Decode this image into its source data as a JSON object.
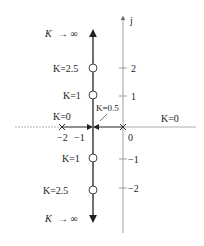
{
  "diagram": {
    "type": "root-locus",
    "axes": {
      "imag_label": "j",
      "real_ticks": [
        {
          "label": "−2",
          "value": -2
        },
        {
          "label": "−1",
          "value": -1
        },
        {
          "label": "0",
          "value": 0
        }
      ],
      "imag_ticks": [
        {
          "label": "2",
          "value": 2
        },
        {
          "label": "1",
          "value": 1
        },
        {
          "label": "−1",
          "value": -1
        },
        {
          "label": "−2",
          "value": -2
        }
      ]
    },
    "poles": [
      {
        "value": -2,
        "label": "K=0"
      },
      {
        "value": 0,
        "label": "K=0"
      }
    ],
    "breakaway": {
      "value": -1,
      "label": "K=0.5"
    },
    "locus_points": [
      {
        "label": "K=2.5",
        "imag": 2
      },
      {
        "label": "K=1",
        "imag": 1
      },
      {
        "label": "K=1",
        "imag": -1
      },
      {
        "label": "K=2.5",
        "imag": -2
      }
    ],
    "asymptote_labels": {
      "top": "K → ∞",
      "bottom": "K → ∞"
    }
  },
  "labels": {
    "j": "j",
    "k_inf_top_k": "K",
    "k_inf_top_rest": "→ ∞",
    "k_inf_bot_k": "K",
    "k_inf_bot_rest": "→ ∞",
    "k25_top": "K=2.5",
    "k1_top": "K=1",
    "k05": "K=0.5",
    "k0_left": "K=0",
    "k0_right": "K=0",
    "k1_bot": "K=1",
    "k25_bot": "K=2.5",
    "tick_2": "2",
    "tick_1": "1",
    "tick_m1": "−1",
    "tick_m2": "−2",
    "real_m2": "−2",
    "real_m1": "−1",
    "real_0": "0"
  },
  "colors": {
    "locus": "#222222",
    "axis": "#888888"
  }
}
